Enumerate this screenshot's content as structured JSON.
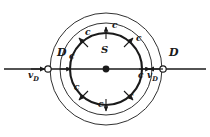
{
  "figure": {
    "background_color": "#ffffff",
    "stroke_color": "#1a1a1a",
    "center": {
      "x": 106,
      "y": 69
    },
    "source": {
      "label": "S",
      "marker": "filled-dot",
      "dot_radius": 3.4,
      "label_x": 101,
      "label_y": 52
    },
    "axis": {
      "name": "horizontal-axis-line",
      "x1": 4,
      "x2": 206,
      "y": 69,
      "stroke_width": 1.3
    },
    "wavefronts": [
      {
        "name": "inner-wavefront",
        "radius": 36,
        "stroke_width": 2.1
      },
      {
        "name": "middle-wavefront",
        "radius": 46,
        "stroke_width": 0.9
      },
      {
        "name": "outer-wavefront",
        "radius": 56,
        "stroke_width": 0.9
      }
    ],
    "detectors": [
      {
        "name": "detector-left",
        "label": "D",
        "label_x": 57,
        "label_y": 54,
        "marker_x": 48,
        "marker_y": 69,
        "marker_radius": 3.2,
        "velocity_label": "v",
        "velocity_sub": "D",
        "velocity_label_x": 29,
        "velocity_label_y": 71,
        "velocity_arrow": {
          "x1": 31,
          "y1": 69,
          "x2": 45,
          "y2": 69,
          "direction": "right"
        }
      },
      {
        "name": "detector-right",
        "label": "D",
        "label_x": 169,
        "label_y": 54,
        "marker_x": 163,
        "marker_y": 69,
        "marker_radius": 3.2,
        "velocity_label": "v",
        "velocity_sub": "D",
        "velocity_label_x": 147,
        "velocity_label_y": 71,
        "velocity_arrow": {
          "x1": 163,
          "y1": 69,
          "x2": 149,
          "y2": 69,
          "direction": "left"
        }
      }
    ],
    "speed_label": "c",
    "speed_arrows": [
      {
        "name": "speed-arrow-top",
        "label": "c",
        "label_x": 112,
        "label_y": 25,
        "x1": 106,
        "y1": 39,
        "x2": 106,
        "y2": 27
      },
      {
        "name": "speed-arrow-upper-left",
        "label": "c",
        "label_x": 86,
        "label_y": 31,
        "x1": 88,
        "y1": 47,
        "x2": 79,
        "y2": 38
      },
      {
        "name": "speed-arrow-upper-right",
        "label": "c",
        "label_x": 137,
        "label_y": 38,
        "x1": 124,
        "y1": 47,
        "x2": 133,
        "y2": 38
      },
      {
        "name": "speed-arrow-left",
        "label": "c",
        "label_x": 69,
        "label_y": 55,
        "x1": 60,
        "y1": 69,
        "x2": 71,
        "y2": 69
      },
      {
        "name": "speed-arrow-right",
        "label": "c",
        "label_x": 139,
        "label_y": 74,
        "x1": 139,
        "y1": 69,
        "x2": 150,
        "y2": 69
      },
      {
        "name": "speed-arrow-lower-left",
        "label": "c",
        "label_x": 75,
        "label_y": 86,
        "x1": 88,
        "y1": 91,
        "x2": 79,
        "y2": 100
      },
      {
        "name": "speed-arrow-bottom",
        "label": "c",
        "label_x": 99,
        "label_y": 103,
        "x1": 106,
        "y1": 99,
        "x2": 106,
        "y2": 111
      },
      {
        "name": "speed-arrow-lower-right",
        "label": "c",
        "label_x": 128,
        "label_y": 95,
        "x1": 124,
        "y1": 91,
        "x2": 133,
        "y2": 100
      }
    ]
  }
}
